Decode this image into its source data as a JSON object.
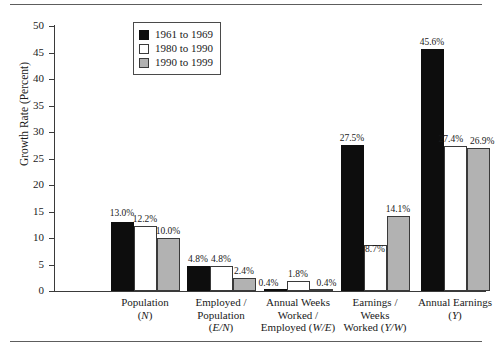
{
  "chart_data": {
    "type": "bar",
    "title": "",
    "xlabel": "",
    "ylabel": "Growth Rate (Percent)",
    "ylim": [
      0,
      50
    ],
    "ytick_step": 5,
    "yticks": [
      "0",
      "5",
      "10",
      "15",
      "20",
      "25",
      "30",
      "35",
      "40",
      "45",
      "50"
    ],
    "grid": false,
    "legend_position": "top-center",
    "categories": [
      "Population (N)",
      "Employed / Population (E/N)",
      "Annual Weeks Worked / Employed (W/E)",
      "Earnings / Weeks Worked (Y/W)",
      "Annual Earnings (Y)"
    ],
    "category_lines": [
      [
        "Population",
        "(N)"
      ],
      [
        "Employed /",
        "Population",
        "(E/N)"
      ],
      [
        "Annual Weeks",
        "Worked /",
        "Employed (W/E)"
      ],
      [
        "Earnings /",
        "Weeks",
        "Worked (Y/W)"
      ],
      [
        "Annual Earnings",
        "(Y)"
      ]
    ],
    "series": [
      {
        "name": "1961 to 1969",
        "color": "#0d0d0d",
        "values": [
          13.0,
          4.8,
          0.4,
          27.5,
          45.6
        ],
        "labels": [
          "13.0%",
          "4.8%",
          "0.4%",
          "27.5%",
          "45.6%"
        ]
      },
      {
        "name": "1980 to 1990",
        "color": "#ffffff",
        "values": [
          12.2,
          4.8,
          1.8,
          8.7,
          27.4
        ],
        "labels": [
          "12.2%",
          "4.8%",
          "1.8%",
          "8.7%",
          "27.4%"
        ]
      },
      {
        "name": "1990 to 1999",
        "color": "#b2b2b2",
        "values": [
          10.0,
          2.4,
          0.4,
          14.1,
          26.9
        ],
        "labels": [
          "10.0%",
          "2.4%",
          "0.4%",
          "14.1%",
          "26.9%"
        ]
      }
    ]
  },
  "legend": {
    "items": [
      {
        "label": "1961 to 1969"
      },
      {
        "label": "1980 to 1990"
      },
      {
        "label": "1990 to 1999"
      }
    ]
  },
  "axis": {
    "y_title": "Growth Rate (Percent)"
  }
}
